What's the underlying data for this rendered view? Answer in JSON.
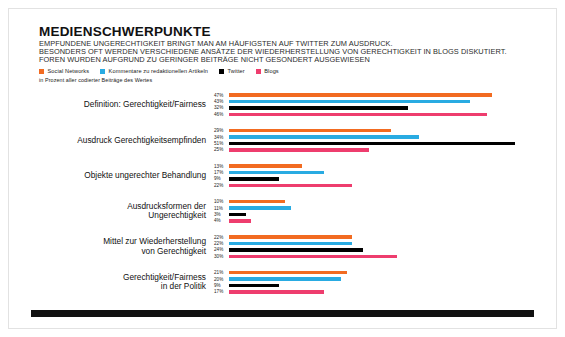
{
  "header": {
    "title": "MEDIENSCHWERPUNKTE",
    "lines": [
      "EMPFUNDENE UNGERECHTIGKEIT BRINGT MAN AM HÄUFIGSTEN AUF TWITTER ZUM AUSDRUCK.",
      "BESONDERS OFT WERDEN VERSCHIEDENE ANSÄTZE DER WIEDERHERSTELLUNG VON GERECHTIGKEIT IN BLOGS DISKUTIERT.",
      "FOREN WURDEN AUFGRUND ZU GERINGER BEITRÄGE NICHT GESONDERT AUSGEWIESEN"
    ],
    "note": "in Prozent aller codierter Beiträge des Wertes"
  },
  "colors": {
    "social_networks": "#F26B21",
    "kommentare": "#29ABE2",
    "twitter": "#000000",
    "blogs": "#EE3D6E",
    "text": "#111111",
    "footer_bar": "#111111"
  },
  "legend": [
    {
      "label": "Social Networks",
      "color": "#F26B21",
      "icon": "square-swatch"
    },
    {
      "label": "Kommentare zu redaktionellen Artikeln",
      "color": "#29ABE2",
      "icon": "square-swatch"
    },
    {
      "label": "Twitter",
      "color": "#000000",
      "icon": "square-swatch"
    },
    {
      "label": "Blogs",
      "color": "#EE3D6E",
      "icon": "square-swatch"
    }
  ],
  "chart_data": {
    "type": "bar",
    "orientation": "horizontal",
    "title": "MEDIENSCHWERPUNKTE",
    "subtitle": "in Prozent aller codierter Beiträge des Wertes",
    "xlabel": "",
    "ylabel": "",
    "xlim": [
      0,
      55
    ],
    "grid": false,
    "legend_position": "top",
    "value_suffix": "%",
    "categories": [
      "Definition: Gerechtigkeit/Fairness",
      "Ausdruck Gerechtigkeitsempfinden",
      "Objekte ungerechter Behandlung",
      "Ausdrucksformen der Ungerechtigkeit",
      "Mittel zur Wiederherstellung von Gerechtigkeit",
      "Gerechtigkeit/Fairness in der Politik"
    ],
    "series": [
      {
        "name": "Social Networks",
        "color": "#F26B21",
        "values": [
          47,
          29,
          13,
          10,
          22,
          21
        ]
      },
      {
        "name": "Kommentare zu redaktionellen Artikeln",
        "color": "#29ABE2",
        "values": [
          43,
          34,
          17,
          11,
          22,
          20
        ]
      },
      {
        "name": "Twitter",
        "color": "#000000",
        "values": [
          32,
          51,
          9,
          3,
          24,
          9
        ]
      },
      {
        "name": "Blogs",
        "color": "#EE3D6E",
        "values": [
          46,
          25,
          22,
          4,
          30,
          17
        ]
      }
    ]
  },
  "groups": [
    {
      "label_lines": [
        "Definition: Gerechtigkeit/Fairness"
      ],
      "rows": [
        {
          "series": "Social Networks",
          "value": "47%",
          "pct": 47,
          "color": "#F26B21"
        },
        {
          "series": "Kommentare zu redaktionellen Artikeln",
          "value": "43%",
          "pct": 43,
          "color": "#29ABE2"
        },
        {
          "series": "Twitter",
          "value": "32%",
          "pct": 32,
          "color": "#000000"
        },
        {
          "series": "Blogs",
          "value": "46%",
          "pct": 46,
          "color": "#EE3D6E"
        }
      ]
    },
    {
      "label_lines": [
        "Ausdruck Gerechtigkeitsempfinden"
      ],
      "rows": [
        {
          "series": "Social Networks",
          "value": "29%",
          "pct": 29,
          "color": "#F26B21"
        },
        {
          "series": "Kommentare zu redaktionellen Artikeln",
          "value": "34%",
          "pct": 34,
          "color": "#29ABE2"
        },
        {
          "series": "Twitter",
          "value": "51%",
          "pct": 51,
          "color": "#000000"
        },
        {
          "series": "Blogs",
          "value": "25%",
          "pct": 25,
          "color": "#EE3D6E"
        }
      ]
    },
    {
      "label_lines": [
        "Objekte ungerechter Behandlung"
      ],
      "rows": [
        {
          "series": "Social Networks",
          "value": "13%",
          "pct": 13,
          "color": "#F26B21"
        },
        {
          "series": "Kommentare zu redaktionellen Artikeln",
          "value": "17%",
          "pct": 17,
          "color": "#29ABE2"
        },
        {
          "series": "Twitter",
          "value": "9%",
          "pct": 9,
          "color": "#000000"
        },
        {
          "series": "Blogs",
          "value": "22%",
          "pct": 22,
          "color": "#EE3D6E"
        }
      ]
    },
    {
      "label_lines": [
        "Ausdrucksformen der",
        "Ungerechtigkeit"
      ],
      "rows": [
        {
          "series": "Social Networks",
          "value": "10%",
          "pct": 10,
          "color": "#F26B21"
        },
        {
          "series": "Kommentare zu redaktionellen Artikeln",
          "value": "11%",
          "pct": 11,
          "color": "#29ABE2"
        },
        {
          "series": "Twitter",
          "value": "3%",
          "pct": 3,
          "color": "#000000"
        },
        {
          "series": "Blogs",
          "value": "4%",
          "pct": 4,
          "color": "#EE3D6E"
        }
      ]
    },
    {
      "label_lines": [
        "Mittel zur Wiederherstellung",
        "von Gerechtigkeit"
      ],
      "rows": [
        {
          "series": "Social Networks",
          "value": "22%",
          "pct": 22,
          "color": "#F26B21"
        },
        {
          "series": "Kommentare zu redaktionellen Artikeln",
          "value": "22%",
          "pct": 22,
          "color": "#29ABE2"
        },
        {
          "series": "Twitter",
          "value": "24%",
          "pct": 24,
          "color": "#000000"
        },
        {
          "series": "Blogs",
          "value": "30%",
          "pct": 30,
          "color": "#EE3D6E"
        }
      ]
    },
    {
      "label_lines": [
        "Gerechtigkeit/Fairness",
        "in der Politik"
      ],
      "rows": [
        {
          "series": "Social Networks",
          "value": "21%",
          "pct": 21,
          "color": "#F26B21"
        },
        {
          "series": "Kommentare zu redaktionellen Artikeln",
          "value": "20%",
          "pct": 20,
          "color": "#29ABE2"
        },
        {
          "series": "Twitter",
          "value": "9%",
          "pct": 9,
          "color": "#000000"
        },
        {
          "series": "Blogs",
          "value": "17%",
          "pct": 17,
          "color": "#EE3D6E"
        }
      ]
    }
  ]
}
